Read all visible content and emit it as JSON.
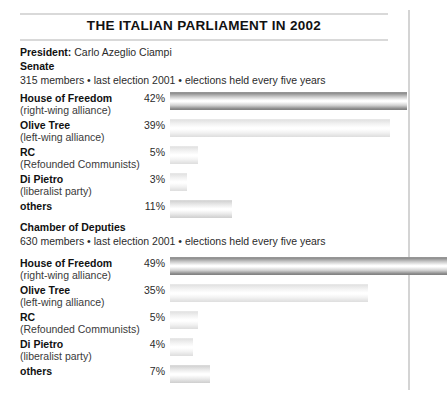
{
  "title": "THE ITALIAN PARLIAMENT IN 2002",
  "president": {
    "label": "President:",
    "name": "Carlo Azeglio Ciampi"
  },
  "chart_data": {
    "type": "bar",
    "title": "THE ITALIAN PARLIAMENT IN 2002",
    "xlabel": "",
    "ylabel": "",
    "xlim": [
      0,
      50
    ],
    "grid": false,
    "legend": "none",
    "orientation": "horizontal",
    "unit": "%",
    "panels": [
      {
        "name": "Senate",
        "subtitle": "315 members • last election 2001 • elections held every five years",
        "members": "315 members",
        "last_election": "last election 2001",
        "term": "elections held every five years",
        "categories": [
          "House of Freedom",
          "Olive Tree",
          "RC",
          "Di Pietro",
          "others"
        ],
        "descriptions": [
          "(right-wing alliance)",
          "(left-wing alliance)",
          "(Refounded Communists)",
          "(liberalist party)",
          ""
        ],
        "values": [
          42,
          39,
          5,
          3,
          11
        ],
        "value_labels": [
          "42%",
          "39%",
          "5%",
          "3%",
          "11%"
        ],
        "shades": [
          "dark",
          "light",
          "light",
          "light",
          "mid"
        ]
      },
      {
        "name": "Chamber of Deputies",
        "subtitle": "630 members • last election 2001 • elections held every five years",
        "members": "630 members",
        "last_election": "last election 2001",
        "term": "elections held every five years",
        "categories": [
          "House of Freedom",
          "Olive Tree",
          "RC",
          "Di Pietro",
          "others"
        ],
        "descriptions": [
          "(right-wing alliance)",
          "(left-wing alliance)",
          "(Refounded Communists)",
          "(liberalist party)",
          ""
        ],
        "values": [
          49,
          35,
          5,
          4,
          7
        ],
        "value_labels": [
          "49%",
          "35%",
          "5%",
          "4%",
          "7%"
        ],
        "shades": [
          "dark",
          "light",
          "light",
          "light",
          "mid"
        ]
      }
    ]
  },
  "style": {
    "bar_origin_x": 170,
    "px_per_percent": 5.65,
    "rule_color": "#d9d9d9",
    "text_color": "#1a1a1a"
  }
}
